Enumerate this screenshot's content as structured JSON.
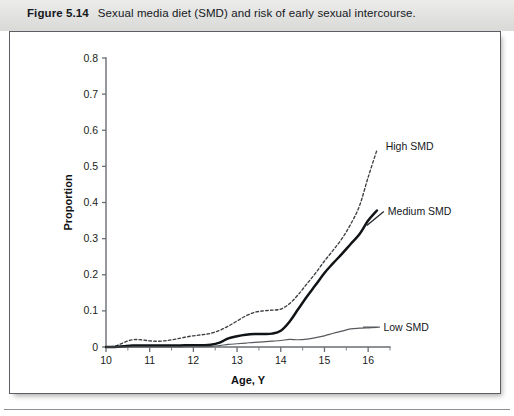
{
  "caption": {
    "label": "Figure 5.14",
    "text": "Sexual media diet (SMD) and risk of early sexual intercourse."
  },
  "chart_data": {
    "type": "line",
    "title": "Sexual media diet (SMD) and risk of early sexual intercourse.",
    "xlabel": "Age, Y",
    "ylabel": "Proportion",
    "xlim": [
      10,
      16.5
    ],
    "ylim": [
      0,
      0.8
    ],
    "xticks": [
      10,
      11,
      12,
      13,
      14,
      15,
      16
    ],
    "xticklabels": [
      "10",
      "11",
      "12",
      "13",
      "14",
      "15",
      "16"
    ],
    "xticks_minor": [
      10.5,
      11.5,
      12.5,
      13.5,
      14.5,
      15.5,
      16.5
    ],
    "yticks": [
      0,
      0.1,
      0.2,
      0.3,
      0.4,
      0.5,
      0.6,
      0.7,
      0.8
    ],
    "yticklabels": [
      "0",
      "0.1",
      "0.2",
      "0.3",
      "0.4",
      "0.5",
      "0.6",
      "0.7",
      "0.8"
    ],
    "grid": false,
    "legend_position": "inline-right-annotations",
    "series": [
      {
        "name": "High SMD",
        "style": "dashed",
        "color": "#3b3f43",
        "label_x": 16.4,
        "label_y": 0.555,
        "x": [
          10.0,
          10.2,
          10.4,
          10.6,
          10.8,
          11.0,
          11.2,
          11.4,
          11.6,
          11.8,
          12.0,
          12.2,
          12.4,
          12.6,
          12.8,
          13.0,
          13.2,
          13.4,
          13.6,
          13.8,
          14.0,
          14.2,
          14.4,
          14.6,
          14.8,
          15.0,
          15.2,
          15.4,
          15.6,
          15.8,
          16.0,
          16.2
        ],
        "y": [
          0.0,
          0.002,
          0.012,
          0.02,
          0.02,
          0.017,
          0.016,
          0.018,
          0.022,
          0.027,
          0.031,
          0.034,
          0.038,
          0.046,
          0.058,
          0.072,
          0.086,
          0.096,
          0.1,
          0.102,
          0.105,
          0.12,
          0.145,
          0.175,
          0.205,
          0.238,
          0.268,
          0.3,
          0.34,
          0.39,
          0.47,
          0.545
        ]
      },
      {
        "name": "Medium SMD",
        "style": "solid-thick",
        "color": "#111417",
        "label_x": 16.45,
        "label_y": 0.375,
        "x": [
          10.0,
          10.2,
          10.4,
          10.6,
          10.8,
          11.0,
          11.2,
          11.4,
          11.6,
          11.8,
          12.0,
          12.2,
          12.4,
          12.6,
          12.8,
          13.0,
          13.2,
          13.4,
          13.6,
          13.8,
          14.0,
          14.2,
          14.4,
          14.6,
          14.8,
          15.0,
          15.2,
          15.4,
          15.6,
          15.8,
          16.0,
          16.2
        ],
        "y": [
          0.0,
          0.0,
          0.002,
          0.004,
          0.004,
          0.004,
          0.004,
          0.004,
          0.004,
          0.005,
          0.005,
          0.005,
          0.006,
          0.012,
          0.024,
          0.03,
          0.034,
          0.036,
          0.036,
          0.037,
          0.045,
          0.07,
          0.105,
          0.14,
          0.172,
          0.205,
          0.232,
          0.258,
          0.285,
          0.312,
          0.35,
          0.378
        ]
      },
      {
        "name": "Low SMD",
        "style": "solid-thin",
        "color": "#56595d",
        "label_x": 16.35,
        "label_y": 0.055,
        "x": [
          10.0,
          10.4,
          10.8,
          11.2,
          11.6,
          12.0,
          12.4,
          12.6,
          12.8,
          13.0,
          13.2,
          13.4,
          13.6,
          13.8,
          14.0,
          14.2,
          14.4,
          14.6,
          14.8,
          15.0,
          15.2,
          15.4,
          15.6,
          15.8,
          16.0,
          16.2
        ],
        "y": [
          0.0,
          0.0,
          0.0,
          0.0,
          0.0,
          0.001,
          0.002,
          0.004,
          0.007,
          0.009,
          0.011,
          0.013,
          0.014,
          0.016,
          0.018,
          0.021,
          0.02,
          0.022,
          0.026,
          0.031,
          0.038,
          0.044,
          0.05,
          0.052,
          0.053,
          0.054
        ]
      }
    ]
  }
}
